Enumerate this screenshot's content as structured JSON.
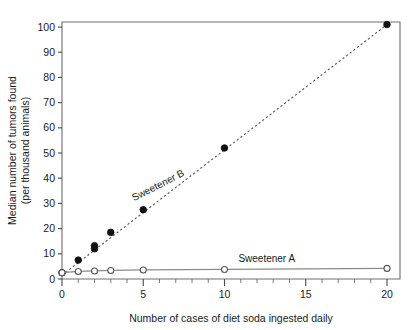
{
  "chart_data": {
    "type": "scatter",
    "title": "",
    "xlabel": "Number of cases of diet soda ingested daily",
    "ylabel": "Median number of tumors found\n(per thousand animals)",
    "ylabel_line1": "Median number of tumors found",
    "ylabel_line2": "(per thousand animals)",
    "xlim": [
      0,
      20.8
    ],
    "ylim": [
      0,
      102
    ],
    "xticks": [
      0,
      5,
      10,
      15,
      20
    ],
    "xtick_labels": [
      "0",
      "5",
      "10",
      "15",
      "20"
    ],
    "x_minor_step": 1,
    "yticks": [
      0,
      10,
      20,
      30,
      40,
      50,
      60,
      70,
      80,
      90,
      100
    ],
    "ytick_labels": [
      "0",
      "10",
      "20",
      "30",
      "40",
      "50",
      "60",
      "70",
      "80",
      "90",
      "100"
    ],
    "grid": false,
    "legend_position": "inline-annotation",
    "series": [
      {
        "name": "Sweetener B",
        "marker": "filled-circle",
        "color": "#111111",
        "line_style": "dashed",
        "annotation": "Sweetener B",
        "annotation_x": 6.0,
        "annotation_y": 36.0,
        "annotation_rotation": -27,
        "x": [
          0,
          1,
          2,
          2,
          3,
          5,
          10,
          20
        ],
        "y": [
          2.5,
          7.5,
          12.0,
          13.2,
          18.5,
          27.5,
          52.0,
          101.0
        ],
        "trend_from": [
          0,
          1.5
        ],
        "trend_to": [
          20,
          101.0
        ]
      },
      {
        "name": "Sweetener A",
        "marker": "open-circle",
        "color": "#555555",
        "line_style": "solid",
        "annotation": "Sweetener A",
        "annotation_x": 12.6,
        "annotation_y": 6.6,
        "annotation_rotation": 0,
        "x": [
          0,
          1,
          2,
          3,
          5,
          10,
          20
        ],
        "y": [
          2.5,
          3.0,
          3.2,
          3.4,
          3.6,
          3.8,
          4.2
        ]
      }
    ]
  },
  "colors": {
    "background": "#ffffff",
    "frame": "#6e6e6e",
    "text": "#1a1a1a",
    "series_b": "#111111",
    "series_a": "#555555",
    "trend": "#555555",
    "connector": "#8a8a8a"
  }
}
